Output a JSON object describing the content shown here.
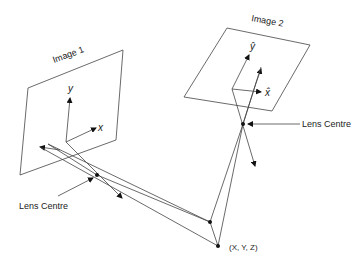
{
  "diagram": {
    "type": "stereo-camera-geometry",
    "images": [
      {
        "label": "Image 1",
        "axes": {
          "x": "x",
          "y": "y"
        }
      },
      {
        "label": "Image 2",
        "axes": {
          "x": "x̂",
          "y": "ŷ"
        }
      }
    ],
    "lens_centres": [
      {
        "label": "Lens Centre"
      },
      {
        "label": "Lens Centre"
      }
    ],
    "world_point": {
      "label": "(X, Y, Z)"
    },
    "colors": {
      "line": "#444444",
      "text": "#222222",
      "background": "#ffffff"
    }
  }
}
